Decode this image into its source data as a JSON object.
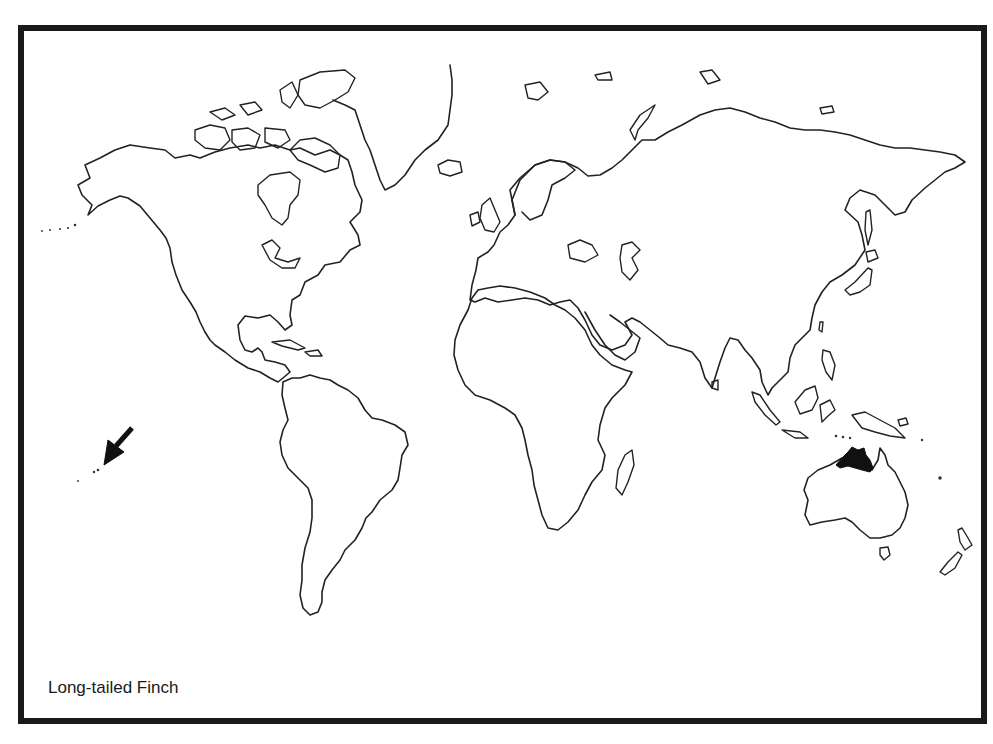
{
  "map": {
    "title": "Long-tailed Finch",
    "style": "black-and-white outline world map",
    "range_color": "#111111",
    "border_color": "#1a1a1a",
    "highlighted_region": "Northern Australia",
    "annotation": {
      "type": "arrow",
      "icon": "arrow-down-left-icon",
      "points_to": "Hawaiian Islands"
    }
  }
}
